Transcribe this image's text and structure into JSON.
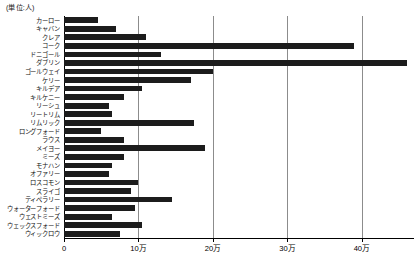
{
  "caption": {
    "unit_note": "(単位:人)"
  },
  "chart_data": {
    "type": "bar",
    "orientation": "horizontal",
    "title": "",
    "subtitle": "",
    "xlabel": "",
    "ylabel": "",
    "unit_note": "(単位:人)",
    "grid": true,
    "legend": false,
    "xlim": [
      0,
      470000
    ],
    "xticks": [
      0,
      100000,
      200000,
      300000,
      400000
    ],
    "xtick_labels": [
      "0",
      "10万",
      "20万",
      "30万",
      "40万"
    ],
    "bar_color": "#1c1c1c",
    "categories": [
      "カーロー",
      "キャバン",
      "クレア",
      "コーク",
      "ドニゴール",
      "ダブリン",
      "ゴールウェイ",
      "ケリー",
      "キルデア",
      "キルケニー",
      "リーシュ",
      "リートリム",
      "リムリック",
      "ロングフォード",
      "ラウス",
      "メイヨー",
      "ミーズ",
      "モナハン",
      "オファリー",
      "ロスコモン",
      "スライゴ",
      "ティペラリー",
      "ウォーターフォード",
      "ウェストミーズ",
      "ウェックスフォード",
      "ウィックロウ"
    ],
    "values": [
      45000,
      70000,
      110000,
      390000,
      130000,
      460000,
      200000,
      170000,
      105000,
      80000,
      60000,
      65000,
      175000,
      50000,
      80000,
      190000,
      80000,
      65000,
      60000,
      100000,
      90000,
      145000,
      95000,
      65000,
      105000,
      75000
    ]
  }
}
